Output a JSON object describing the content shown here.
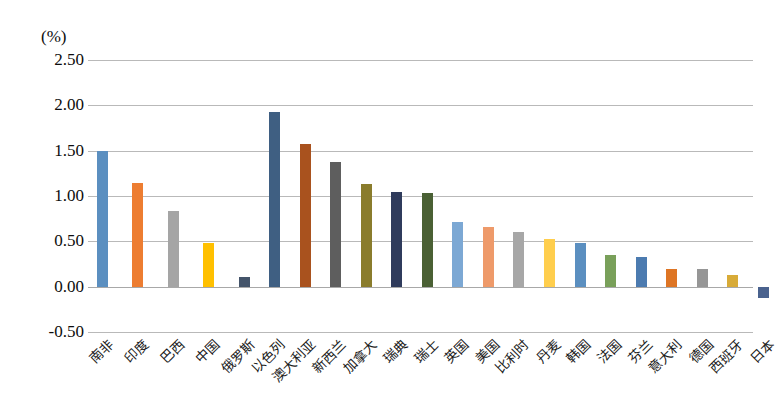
{
  "chart_data": {
    "type": "bar",
    "title": "",
    "subtitle": "",
    "xlabel": "",
    "ylabel": "",
    "unit_label": "(%)",
    "ylim": [
      -0.5,
      2.5
    ],
    "ytick_labels": [
      "2.50",
      "2.00",
      "1.50",
      "1.00",
      "0.50",
      "0.00",
      "-0.50"
    ],
    "ytick_values": [
      2.5,
      2.0,
      1.5,
      1.0,
      0.5,
      0.0,
      -0.5
    ],
    "grid": true,
    "legend": "none",
    "groups": [
      {
        "name": "group-1",
        "start_index": 0,
        "count": 5
      },
      {
        "name": "group-2",
        "start_index": 5,
        "count": 18
      }
    ],
    "categories": [
      "南非",
      "印度",
      "巴西",
      "中国",
      "俄罗斯",
      "以色列",
      "澳大利亚",
      "新西兰",
      "加拿大",
      "瑞典",
      "瑞士",
      "英国",
      "美国",
      "比利时",
      "丹麦",
      "韩国",
      "法国",
      "芬兰",
      "意大利",
      "德国",
      "西班牙",
      "日本"
    ],
    "values": [
      1.5,
      1.14,
      0.83,
      0.48,
      0.11,
      1.93,
      1.57,
      1.37,
      1.13,
      1.04,
      1.03,
      0.71,
      0.66,
      0.6,
      0.53,
      0.48,
      0.35,
      0.33,
      0.2,
      0.19,
      0.13,
      -0.13
    ],
    "colors": [
      "#5B8FC0",
      "#ED7D31",
      "#A5A5A5",
      "#FFC000",
      "#44546A",
      "#3F5F82",
      "#A9521E",
      "#5E5E5E",
      "#8A7C2C",
      "#2F3B5C",
      "#4A6034",
      "#7CA8D4",
      "#EE9A6A",
      "#A7A7A7",
      "#FFCE4D",
      "#5B8FC0",
      "#79A05A",
      "#4C7BB0",
      "#DE7524",
      "#969696",
      "#D8AB38",
      "#4A628E"
    ]
  }
}
